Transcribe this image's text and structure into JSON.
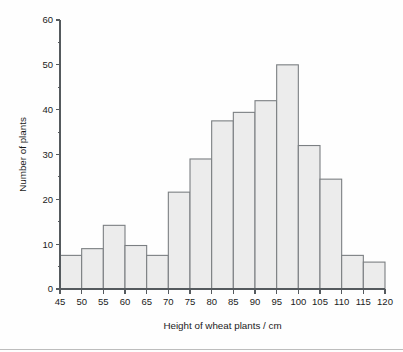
{
  "chart_data": {
    "type": "bar",
    "title": "",
    "subtitle": "",
    "xlabel": "Height of wheat plants / cm",
    "ylabel": "Number of plants",
    "xlim": [
      45,
      120
    ],
    "ylim": [
      0,
      60
    ],
    "grid": false,
    "legend": null,
    "bin_width": 5,
    "x_tick_labels": [
      "45",
      "50",
      "55",
      "60",
      "65",
      "70",
      "75",
      "80",
      "85",
      "90",
      "95",
      "100",
      "105",
      "110",
      "115",
      "120"
    ],
    "x_tick_values": [
      45,
      50,
      55,
      60,
      65,
      70,
      75,
      80,
      85,
      90,
      95,
      100,
      105,
      110,
      115,
      120
    ],
    "y_tick_labels": [
      "0",
      "10",
      "20",
      "30",
      "40",
      "50",
      "60"
    ],
    "y_tick_values": [
      0,
      10,
      20,
      30,
      40,
      50,
      60
    ],
    "y_minor_tick_values": [
      5,
      15,
      25,
      35,
      45,
      55
    ],
    "bin_edges": [
      45,
      50,
      55,
      60,
      65,
      70,
      75,
      80,
      85,
      90,
      95,
      100,
      105,
      110,
      115,
      120
    ],
    "categories": [
      "45-50",
      "50-55",
      "55-60",
      "60-65",
      "65-70",
      "70-75",
      "75-80",
      "80-85",
      "85-90",
      "90-95",
      "95-100",
      "100-105",
      "105-110",
      "110-115",
      "115-120"
    ],
    "values": [
      7.5,
      9,
      14.2,
      9.7,
      7.5,
      21.6,
      29,
      37.5,
      39.4,
      42,
      50,
      32,
      24.5,
      7.5,
      6
    ],
    "colors": {
      "bar_fill": "#ececec",
      "bar_stroke": "#7b7f82",
      "axis": "#555a5e",
      "text": "#1b1b1b",
      "background": "#fefefe"
    }
  }
}
